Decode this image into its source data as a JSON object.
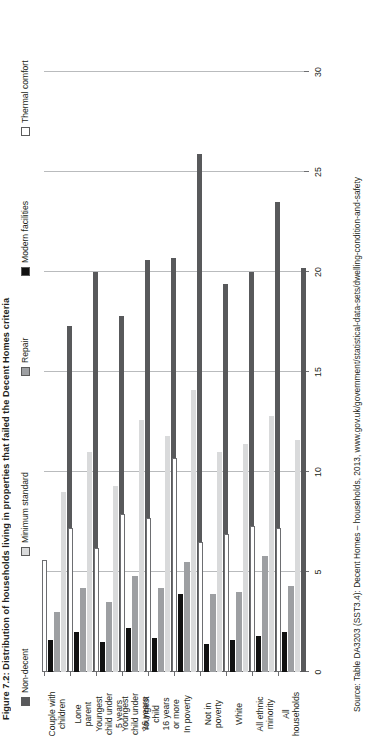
{
  "figure": {
    "title": "Figure 7.2: Distribution of households living in properties that failed the Decent Homes criteria",
    "source": "Source: Table DA3203 (SST3.4): Decent Homes – households, 2013, www.gov.uk/government/statistical-data-sets/dwelling-condition-and-safety"
  },
  "legend": {
    "items": [
      {
        "label": "Non-decent",
        "color": "#58595b",
        "key": "non_decent"
      },
      {
        "label": "Minimum standard",
        "color": "#d9dadb",
        "key": "minimum_standard"
      },
      {
        "label": "Repair",
        "color": "#9d9fa2",
        "key": "repair"
      },
      {
        "label": "Modern facilities",
        "color": "#111111",
        "key": "modern_facilities"
      },
      {
        "label": "Thermal comfort",
        "color": "#ffffff",
        "key": "thermal_comfort"
      }
    ]
  },
  "axis": {
    "ticks": [
      "0",
      "5",
      "10",
      "15",
      "20",
      "25",
      "30"
    ],
    "min": 0,
    "max": 30,
    "label": ""
  },
  "chart_data": {
    "type": "bar",
    "orientation": "horizontal",
    "title": "Figure 7.2: Distribution of households living in properties that failed the Decent Homes criteria",
    "xlabel": "",
    "ylabel": "",
    "xlim": [
      0,
      30
    ],
    "grid": true,
    "legend_position": "top",
    "categories": [
      "Couple with children",
      "Lone parent",
      "Youngest child under 5 years",
      "Youngest child under 16 years",
      "Youngest child 16 years or more",
      "In poverty",
      "Not in poverty",
      "White",
      "All ethnic minority",
      "All households"
    ],
    "category_lines": [
      [
        "Couple with",
        "children"
      ],
      [
        "Lone",
        "parent"
      ],
      [
        "Youngest",
        "child under",
        "5 years"
      ],
      [
        "Youngest",
        "child under",
        "16 years"
      ],
      [
        "Youngest",
        "child",
        "16 years",
        "or more"
      ],
      [
        "In poverty"
      ],
      [
        "Not in",
        "poverty"
      ],
      [
        "White"
      ],
      [
        "All ethnic",
        "minority"
      ],
      [
        "All",
        "households"
      ]
    ],
    "series": [
      {
        "name": "Non-decent",
        "color": "#58595b",
        "values": [
          17.3,
          20.0,
          17.8,
          20.6,
          20.7,
          25.9,
          19.4,
          20.0,
          23.5,
          20.2
        ]
      },
      {
        "name": "Minimum standard",
        "color": "#d9dadb",
        "values": [
          9.0,
          11.0,
          9.3,
          12.6,
          11.8,
          14.1,
          11.0,
          11.4,
          12.8,
          11.6
        ]
      },
      {
        "name": "Repair",
        "color": "#9d9fa2",
        "values": [
          3.0,
          4.2,
          3.5,
          4.8,
          4.2,
          5.5,
          3.9,
          4.0,
          5.8,
          4.3
        ]
      },
      {
        "name": "Modern facilities",
        "color": "#111111",
        "values": [
          1.6,
          2.0,
          1.5,
          2.2,
          1.7,
          3.9,
          1.4,
          1.6,
          1.8,
          2.0
        ]
      },
      {
        "name": "Thermal comfort",
        "color": "#ffffff",
        "values": [
          5.6,
          7.2,
          6.2,
          7.9,
          7.7,
          10.7,
          6.5,
          6.9,
          7.3,
          7.2
        ]
      }
    ]
  }
}
